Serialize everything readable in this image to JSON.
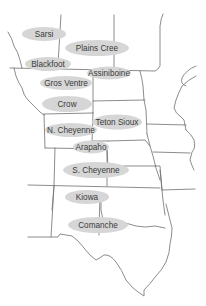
{
  "map": {
    "title": "",
    "oval_color": "#d6d6d6",
    "line_color": "#6e6e6e",
    "label_color": "#3a3a3a",
    "tribes": [
      {
        "name": "Sarsi",
        "cx": 44,
        "cy": 34,
        "rx": 22,
        "ry": 7
      },
      {
        "name": "Plains Cree",
        "cx": 97,
        "cy": 48,
        "rx": 32,
        "ry": 8
      },
      {
        "name": "Blackfoot",
        "cx": 48,
        "cy": 64,
        "rx": 23,
        "ry": 7
      },
      {
        "name": "Assiniboine",
        "cx": 109,
        "cy": 73,
        "rx": 22,
        "ry": 6.5
      },
      {
        "name": "Gros Ventre",
        "cx": 66,
        "cy": 83,
        "rx": 26,
        "ry": 7
      },
      {
        "name": "Crow",
        "cx": 67,
        "cy": 104,
        "rx": 25,
        "ry": 8
      },
      {
        "name": "Teton Sioux",
        "cx": 117,
        "cy": 122,
        "rx": 25,
        "ry": 7.5
      },
      {
        "name": "N. Cheyenne",
        "cx": 71,
        "cy": 130,
        "rx": 26,
        "ry": 7
      },
      {
        "name": "Arapaho",
        "cx": 91,
        "cy": 147,
        "rx": 18,
        "ry": 6.5
      },
      {
        "name": "S. Cheyenne",
        "cx": 96,
        "cy": 170,
        "rx": 33,
        "ry": 8
      },
      {
        "name": "Kiowa",
        "cx": 87,
        "cy": 197,
        "rx": 22,
        "ry": 7
      },
      {
        "name": "Comanche",
        "cx": 98,
        "cy": 225,
        "rx": 30,
        "ry": 8
      }
    ]
  }
}
